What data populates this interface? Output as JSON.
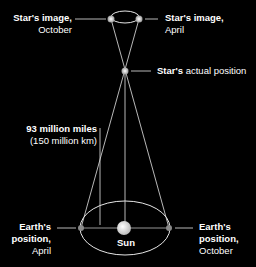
{
  "labels": {
    "star_image_october": {
      "line1": "Star's image,",
      "line2": "October"
    },
    "star_image_april": {
      "line1": "Star's image,",
      "line2": "April"
    },
    "star_actual": {
      "bold": "Star's",
      "rest": " actual position"
    },
    "distance": {
      "line1": "93 million miles",
      "line2": "(150 million km)"
    },
    "earth_april": {
      "line1": "Earth's",
      "line2": "position,",
      "line3": "April"
    },
    "earth_october": {
      "line1": "Earth's",
      "line2": "position,",
      "line3": "October"
    },
    "sun": "Sun"
  },
  "colors": {
    "background": "#000000",
    "line": "#e6e6e6",
    "point": "#f2f2f2",
    "text": "#ffffff"
  }
}
